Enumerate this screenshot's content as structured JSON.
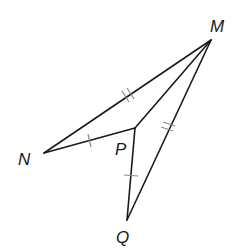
{
  "diagram": {
    "type": "geometry-figure",
    "points": {
      "M": {
        "label": "M",
        "x": 211,
        "y": 40
      },
      "N": {
        "label": "N",
        "x": 44,
        "y": 153
      },
      "P": {
        "label": "P",
        "x": 135,
        "y": 128
      },
      "Q": {
        "label": "Q",
        "x": 127,
        "y": 220
      }
    },
    "segments": [
      {
        "from": "N",
        "to": "M",
        "ticks": 2
      },
      {
        "from": "M",
        "to": "Q",
        "ticks": 2
      },
      {
        "from": "N",
        "to": "P",
        "ticks": 1
      },
      {
        "from": "P",
        "to": "Q",
        "ticks": 1
      },
      {
        "from": "P",
        "to": "M",
        "ticks": 0
      }
    ],
    "congruence": [
      "NM ≅ QM (double tick)",
      "NP ≅ QP (single tick)"
    ],
    "colors": {
      "line": "#1a1a1a",
      "tick": "#8a8a8a",
      "background": "#ffffff"
    }
  }
}
